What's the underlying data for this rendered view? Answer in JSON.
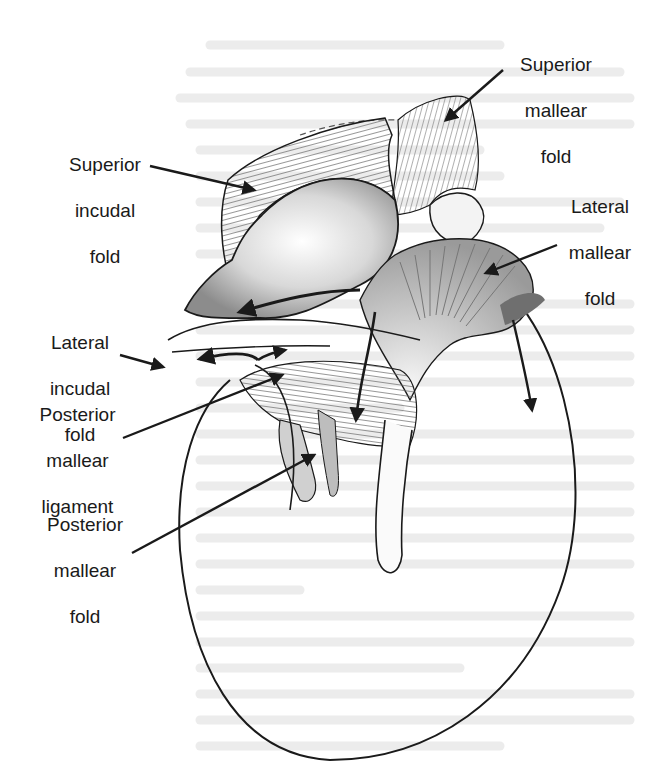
{
  "figure": {
    "labels": [
      {
        "id": "superior-mallear-fold",
        "lines": [
          "Superior",
          "mallear",
          "fold"
        ]
      },
      {
        "id": "superior-incudal-fold",
        "lines": [
          "Superior",
          "incudal",
          "fold"
        ]
      },
      {
        "id": "lateral-mallear-fold",
        "lines": [
          "Lateral",
          "mallear",
          "fold"
        ]
      },
      {
        "id": "lateral-incudal-fold",
        "lines": [
          "Lateral",
          "incudal",
          "fold"
        ]
      },
      {
        "id": "posterior-mallear-ligament",
        "lines": [
          "Posterior",
          "mallear",
          "ligament"
        ]
      },
      {
        "id": "posterior-mallear-fold",
        "lines": [
          "Posterior",
          "mallear",
          "fold"
        ]
      }
    ],
    "colors": {
      "ink": "#1a1a1a",
      "shade": "#8a8a8a",
      "light_shade": "#c4c4c4",
      "bleed_text": "#e8e8e8",
      "background": "#ffffff"
    }
  }
}
